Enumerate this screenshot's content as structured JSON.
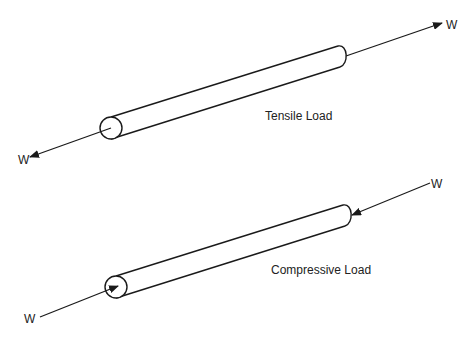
{
  "diagram": {
    "stroke_color": "#1a1a1a",
    "tensile": {
      "label": "Tensile Load",
      "force_symbol_right": "W",
      "force_symbol_left": "W",
      "arrow_direction": "outward"
    },
    "compressive": {
      "label": "Compressive Load",
      "force_symbol_right": "W",
      "force_symbol_left": "W",
      "arrow_direction": "inward"
    }
  }
}
